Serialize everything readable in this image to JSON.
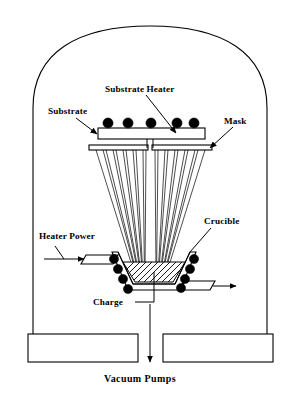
{
  "diagram": {
    "type": "schematic-cross-section",
    "background_color": "#ffffff",
    "line_color": "#000000",
    "labels": {
      "substrate_heater": "Substrate Heater",
      "substrate": "Substrate",
      "mask": "Mask",
      "heater_power": "Heater Power",
      "crucible": "Crucible",
      "charge": "Charge",
      "vacuum_pumps": "Vacuum Pumps"
    },
    "components": {
      "bell_jar": {
        "name": "bell-jar",
        "shape": "domed-chamber",
        "left_x": 33,
        "right_x": 267,
        "dome_top_y": 26,
        "wall_bottom_y": 334
      },
      "substrate": {
        "name": "substrate",
        "shape": "rectangle",
        "x": 98,
        "y": 128,
        "width": 107,
        "height": 11
      },
      "substrate_heater": {
        "name": "substrate-heater-coils",
        "shape": "row-of-filled-circles",
        "count": 5,
        "radius": 5.1,
        "center_y": 123,
        "centers_x": [
          108,
          128,
          151,
          177,
          194
        ]
      },
      "mask": {
        "name": "mask",
        "shape": "split-bar",
        "y": 145,
        "height": 5,
        "left_segment": {
          "x": 89,
          "width": 59
        },
        "right_segment": {
          "x": 152,
          "width": 60
        },
        "gap_center_x": 150
      },
      "vapor_beam": {
        "name": "vapor-beam-fan",
        "shape": "fan-of-rays",
        "ray_pairs_left": 6,
        "ray_pairs_right": 6,
        "source_y": 272,
        "source_half_width": 17,
        "top_y": 150
      },
      "crucible": {
        "name": "crucible",
        "shape": "trapezoid",
        "top_y": 252,
        "bottom_y": 284,
        "top_left_x": 118,
        "top_right_x": 190,
        "bottom_left_x": 133,
        "bottom_right_x": 175
      },
      "charge": {
        "name": "charge-material",
        "shape": "hatched-trapezoid",
        "hatch_count": 9
      },
      "crucible_heater": {
        "name": "crucible-heater-coils",
        "shape": "filled-circles",
        "count_left": 4,
        "count_right": 4,
        "radius": 4.6
      },
      "electrode_left": {
        "name": "heater-power-electrode-left",
        "shape": "parallelogram-tab"
      },
      "electrode_right": {
        "name": "heater-power-electrode-right",
        "shape": "parallelogram-tab"
      },
      "base_block_left": {
        "name": "base-plate-left",
        "shape": "rectangle",
        "x": 28,
        "y": 334,
        "width": 110,
        "height": 28
      },
      "base_block_right": {
        "name": "base-plate-right",
        "shape": "rectangle",
        "x": 163,
        "y": 334,
        "width": 110,
        "height": 28
      },
      "pump_arrow": {
        "name": "vacuum-pump-arrow",
        "direction": "down",
        "x": 150,
        "from_y": 304,
        "to_y": 362
      }
    }
  }
}
